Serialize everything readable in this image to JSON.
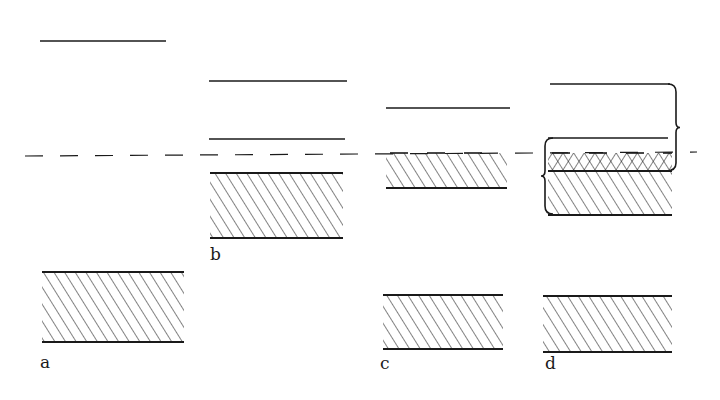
{
  "diagram": {
    "colors": {
      "ink": "#1a1a1a",
      "background": "#ffffff"
    },
    "reference_line": {
      "style": "dashed",
      "y": 156,
      "x_start": 25,
      "x_end": 697
    },
    "panels": [
      {
        "id": "a",
        "label": "a",
        "label_pos": [
          40,
          358
        ],
        "lines": [
          {
            "x1": 40,
            "x2": 166,
            "y": 41
          }
        ],
        "hatched_bands": [
          {
            "x1": 42,
            "x2": 184,
            "y_top": 272,
            "y_bottom": 342,
            "pattern": "single"
          }
        ]
      },
      {
        "id": "b",
        "label": "b",
        "label_pos": [
          210,
          250
        ],
        "lines": [
          {
            "x1": 209,
            "x2": 347,
            "y": 81
          },
          {
            "x1": 209,
            "x2": 345,
            "y": 139
          }
        ],
        "hatched_bands": [
          {
            "x1": 210,
            "x2": 343,
            "y_top": 173,
            "y_bottom": 238,
            "pattern": "single"
          }
        ]
      },
      {
        "id": "c",
        "label": "c",
        "label_pos": [
          380,
          359
        ],
        "lines": [
          {
            "x1": 386,
            "x2": 510,
            "y": 108
          }
        ],
        "hatched_bands": [
          {
            "x1": 386,
            "x2": 507,
            "y_top": 153,
            "y_bottom": 188,
            "pattern": "single",
            "top_edge": "broken"
          },
          {
            "x1": 383,
            "x2": 503,
            "y_top": 295,
            "y_bottom": 349,
            "pattern": "single"
          }
        ]
      },
      {
        "id": "d",
        "label": "d",
        "label_pos": [
          545,
          359
        ],
        "lines": [
          {
            "x1": 550,
            "x2": 670,
            "y": 84
          },
          {
            "x1": 548,
            "x2": 668,
            "y": 138
          }
        ],
        "hatched_bands": [
          {
            "x1": 548,
            "x2": 672,
            "y_top": 153,
            "y_bottom": 171,
            "pattern": "cross",
            "top_edge": "broken"
          },
          {
            "x1": 548,
            "x2": 672,
            "y_top": 171,
            "y_bottom": 215,
            "pattern": "single"
          },
          {
            "x1": 543,
            "x2": 672,
            "y_top": 296,
            "y_bottom": 352,
            "pattern": "single"
          }
        ],
        "braces": [
          {
            "side": "right",
            "x": 680,
            "y_top": 84,
            "y_bottom": 171
          },
          {
            "side": "left",
            "x": 543,
            "y_top": 138,
            "y_bottom": 214
          }
        ]
      }
    ]
  }
}
